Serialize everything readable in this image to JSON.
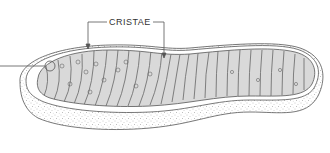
{
  "diagram": {
    "labels": {
      "cristae": "CRISTAE"
    },
    "colors": {
      "line": "#555555",
      "matrix_fill": "#d9d9d9",
      "outer_fill": "#ffffff",
      "stipple": "#8a8a8a"
    }
  }
}
